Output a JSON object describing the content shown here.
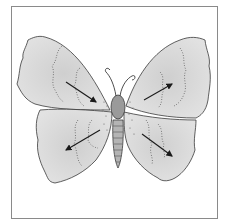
{
  "figure": {
    "colors": {
      "wing_fill": "#dcdcdc",
      "wing_shade": "#c4c4c4",
      "outline": "#3a3a3a",
      "body": "#9a9a9a",
      "frame": "#8a8a8a",
      "arrow": "#1a1a1a"
    },
    "arrows": [
      {
        "wing": "upper-left",
        "direction": "toward body (down-right)"
      },
      {
        "wing": "upper-right",
        "direction": "outward (up-right)"
      },
      {
        "wing": "lower-left",
        "direction": "outward (down-left)"
      },
      {
        "wing": "lower-right",
        "direction": "outward (down-right)"
      }
    ]
  }
}
